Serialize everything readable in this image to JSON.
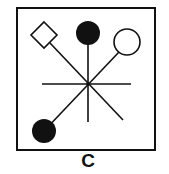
{
  "diagram": {
    "label": "C",
    "colors": {
      "stroke": "#111111",
      "fill": "#111111",
      "background": "#ffffff"
    },
    "frame": {
      "x": 17,
      "y": 8,
      "width": 138,
      "height": 142
    },
    "center": {
      "x": 88,
      "y": 84
    },
    "spokes": [
      {
        "name": "horizontal",
        "x1": 42,
        "y1": 84,
        "x2": 131,
        "y2": 84
      },
      {
        "name": "vertical",
        "x1": 88,
        "y1": 36,
        "x2": 88,
        "y2": 122
      },
      {
        "name": "diagonal-nw-se",
        "x1": 50,
        "y1": 43,
        "x2": 123,
        "y2": 120
      },
      {
        "name": "diagonal-sw-ne",
        "x1": 44,
        "y1": 131,
        "x2": 119,
        "y2": 52
      }
    ],
    "nodes": [
      {
        "name": "open-diamond",
        "shape": "diamond",
        "filled": false,
        "cx": 44,
        "cy": 35,
        "r": 13
      },
      {
        "name": "filled-circle-top",
        "shape": "circle",
        "filled": true,
        "cx": 88,
        "cy": 33,
        "r": 12
      },
      {
        "name": "open-circle",
        "shape": "circle",
        "filled": false,
        "cx": 127,
        "cy": 42,
        "r": 13
      },
      {
        "name": "filled-circle-bottom-left",
        "shape": "circle",
        "filled": true,
        "cx": 44,
        "cy": 131,
        "r": 12
      }
    ]
  }
}
